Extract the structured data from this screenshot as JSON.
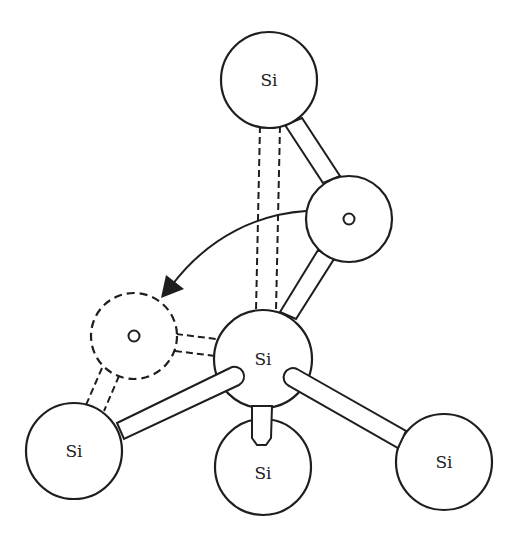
{
  "diagram": {
    "type": "atomic-structure",
    "stroke_color": "#1e1e1e",
    "background": "#ffffff",
    "atoms": [
      {
        "id": "si-top",
        "label": "Si",
        "element": "Si",
        "cx": 269,
        "cy": 80,
        "r": 48,
        "style": "solid"
      },
      {
        "id": "o-right",
        "label": "",
        "element": "O",
        "cx": 349,
        "cy": 219,
        "r": 43,
        "style": "solid"
      },
      {
        "id": "o-left",
        "label": "",
        "element": "O",
        "cx": 134,
        "cy": 336,
        "r": 43,
        "style": "dashed"
      },
      {
        "id": "si-center",
        "label": "Si",
        "element": "Si",
        "cx": 263,
        "cy": 359,
        "r": 49,
        "style": "solid"
      },
      {
        "id": "si-lower-left",
        "label": "Si",
        "element": "Si",
        "cx": 74,
        "cy": 451,
        "r": 48,
        "style": "solid"
      },
      {
        "id": "si-bottom",
        "label": "Si",
        "element": "Si",
        "cx": 263,
        "cy": 467,
        "r": 48,
        "style": "solid"
      },
      {
        "id": "si-lower-right",
        "label": "Si",
        "element": "Si",
        "cx": 444,
        "cy": 462,
        "r": 48,
        "style": "solid"
      }
    ],
    "bonds": [
      {
        "from": "si-top",
        "to": "o-right",
        "style": "solid"
      },
      {
        "from": "o-right",
        "to": "si-center",
        "style": "solid"
      },
      {
        "from": "si-top",
        "to": "si-center",
        "style": "dashed"
      },
      {
        "from": "o-left",
        "to": "si-center",
        "style": "dashed"
      },
      {
        "from": "o-left",
        "to": "si-lower-left",
        "style": "dashed"
      },
      {
        "from": "si-lower-left",
        "to": "si-center",
        "style": "solid"
      },
      {
        "from": "si-center",
        "to": "si-lower-right",
        "style": "solid"
      },
      {
        "from": "si-center",
        "to": "si-bottom",
        "style": "solid"
      }
    ],
    "arrow": {
      "from": "o-right",
      "to": "o-left",
      "meaning": "oxygen migration"
    },
    "labels": {
      "si_top": "Si",
      "si_center": "Si",
      "si_lower_left": "Si",
      "si_bottom": "Si",
      "si_lower_right": "Si"
    }
  }
}
